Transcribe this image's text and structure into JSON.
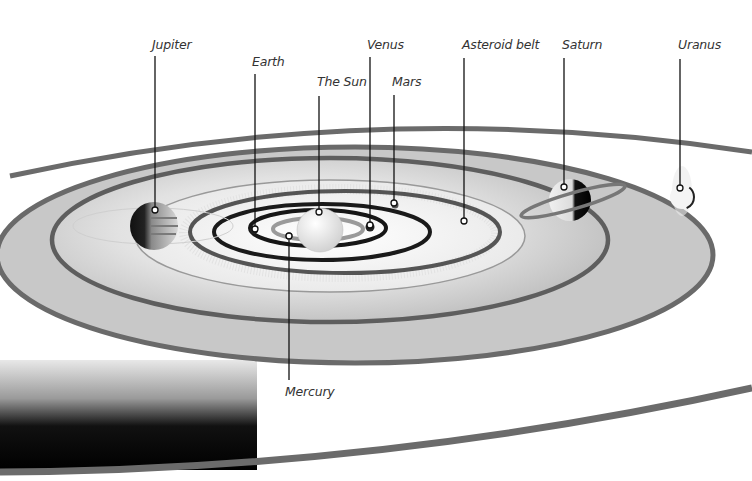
{
  "diagram": {
    "colors": {
      "background": "#ffffff",
      "disc_fill": "#c9c9c9",
      "orbit_ring_outer": "#6a6a6a",
      "orbit_ring_inner": "#1c1c1c",
      "leader_line": "#111111",
      "label_text": "#333333"
    },
    "labels": [
      {
        "id": "jupiter",
        "text": "Jupiter"
      },
      {
        "id": "earth",
        "text": "Earth"
      },
      {
        "id": "sun",
        "text": "The Sun"
      },
      {
        "id": "venus",
        "text": "Venus"
      },
      {
        "id": "mars",
        "text": "Mars"
      },
      {
        "id": "asteroid-belt",
        "text": "Asteroid belt"
      },
      {
        "id": "saturn",
        "text": "Saturn"
      },
      {
        "id": "uranus",
        "text": "Uranus"
      },
      {
        "id": "mercury",
        "text": "Mercury"
      }
    ]
  }
}
